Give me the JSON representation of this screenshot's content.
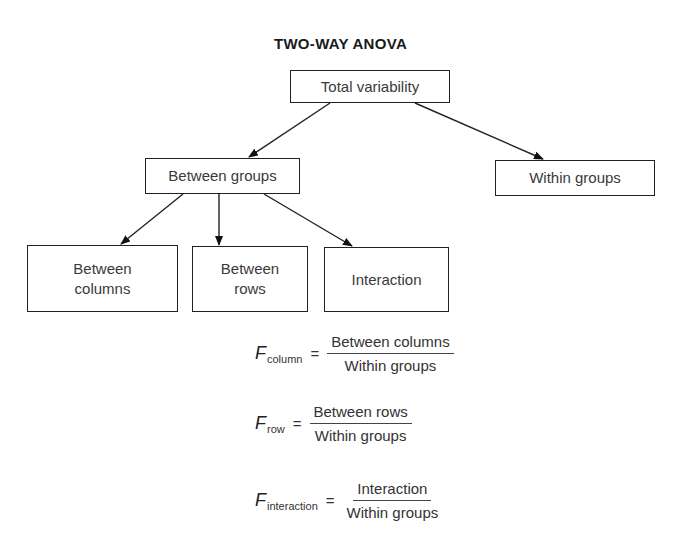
{
  "diagram": {
    "title": "TWO-WAY ANOVA",
    "nodes": {
      "total": {
        "label": "Total variability"
      },
      "between_groups": {
        "label": "Between groups"
      },
      "within_groups": {
        "label": "Within groups"
      },
      "between_columns": {
        "line1": "Between",
        "line2": "columns"
      },
      "between_rows": {
        "line1": "Between",
        "line2": "rows"
      },
      "interaction": {
        "label": "Interaction"
      }
    },
    "edges": [
      {
        "from": "Total variability",
        "to": "Between groups"
      },
      {
        "from": "Total variability",
        "to": "Within groups"
      },
      {
        "from": "Between groups",
        "to": "Between columns"
      },
      {
        "from": "Between groups",
        "to": "Between rows"
      },
      {
        "from": "Between groups",
        "to": "Interaction"
      }
    ]
  },
  "formulas": [
    {
      "symbol": "F",
      "subscript": "column",
      "equals": "=",
      "numerator": "Between columns",
      "denominator": "Within groups"
    },
    {
      "symbol": "F",
      "subscript": "row",
      "equals": "=",
      "numerator": "Between rows",
      "denominator": "Within groups"
    },
    {
      "symbol": "F",
      "subscript": "interaction",
      "equals": "=",
      "numerator": "Interaction",
      "denominator": "Within groups"
    }
  ]
}
